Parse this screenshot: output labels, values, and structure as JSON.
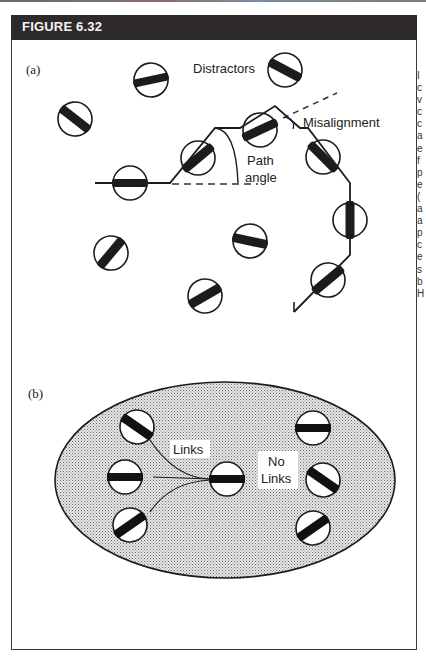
{
  "figure": {
    "title": "FIGURE 6.32",
    "header_color": "#2e2a2b"
  },
  "panel_a": {
    "label": "(a)",
    "annotations": {
      "distractors": "Distractors",
      "misalignment": "Misalignment",
      "path_line1": "Path",
      "path_line2": "angle"
    }
  },
  "panel_b": {
    "label": "(b)",
    "annotations": {
      "links": "Links",
      "no_links_line1": "No",
      "no_links_line2": "Links"
    }
  },
  "side_text_fragments": [
    "I",
    "c",
    "v",
    "c",
    "c",
    "a",
    "e",
    "f",
    "p",
    "e",
    "(",
    "a",
    "a",
    "p",
    "c",
    "e",
    "s",
    "b",
    "H"
  ]
}
